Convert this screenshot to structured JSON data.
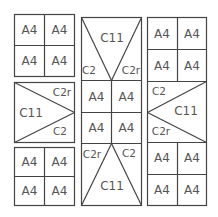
{
  "diagram": {
    "title": "",
    "labels": {
      "a4": "A4",
      "c11": "C11",
      "c2": "C2",
      "c2r": "C2r"
    },
    "columns": [
      {
        "name": "left",
        "blocks": [
          "A4 2x2 grid",
          "C11 triangle with C2r and C2",
          "A4 2x2 grid"
        ]
      },
      {
        "name": "middle",
        "blocks": [
          "C11 inverted trapezoid with C2 and C2r",
          "A4 2x2 grid",
          "C11 trapezoid with C2r and C2"
        ]
      },
      {
        "name": "right",
        "blocks": [
          "A4 2x2 grid",
          "C11 triangle with C2 and C2r",
          "A4 2x2 grid"
        ]
      }
    ]
  }
}
